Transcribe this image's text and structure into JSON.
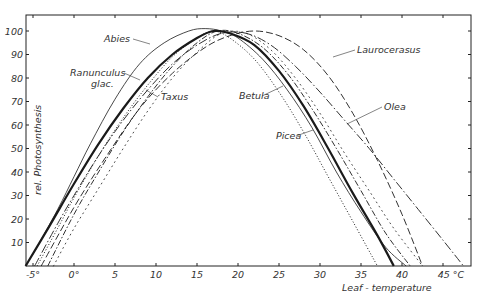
{
  "chart_data": {
    "type": "line",
    "title": "",
    "xlabel": "Leaf - temperature",
    "ylabel": "rel. Photosynthesis",
    "x_unit": "°C",
    "xlim": [
      -5.9,
      48.4
    ],
    "ylim": [
      0,
      107
    ],
    "grid": false,
    "legend_position": "inline labels",
    "x_ticks": [
      -5,
      0,
      5,
      10,
      15,
      20,
      25,
      30,
      35,
      40,
      45
    ],
    "x_tick_labels": [
      "-5°",
      "0°",
      "5",
      "10",
      "15",
      "20",
      "25",
      "30",
      "35",
      "40",
      "45 °C"
    ],
    "y_ticks": [
      10,
      20,
      30,
      40,
      50,
      60,
      70,
      80,
      90,
      100
    ],
    "y_tick_labels": [
      "10",
      "20",
      "30",
      "40",
      "50",
      "60",
      "70",
      "80",
      "90",
      "100"
    ],
    "series": [
      {
        "name": "Abies",
        "style": "thin-solid",
        "x": [
          -5,
          -2,
          0,
          2,
          5,
          8,
          11,
          14,
          16,
          18,
          20,
          23,
          26,
          29,
          32,
          35,
          38,
          40.5
        ],
        "y": [
          5,
          24,
          38,
          52,
          71,
          86,
          95,
          100,
          101,
          100,
          97,
          88,
          75,
          59,
          40,
          23,
          8,
          0
        ]
      },
      {
        "name": "Ranunculus glac.",
        "style": "thick-solid",
        "x": [
          -5.9,
          -3,
          0,
          3,
          6,
          9,
          12,
          15,
          17,
          19,
          22,
          25,
          28,
          31,
          34,
          37,
          39
        ],
        "y": [
          0,
          17,
          35,
          52,
          67,
          80,
          90,
          97,
          100,
          99,
          94,
          83,
          68,
          50,
          31,
          13,
          0
        ]
      },
      {
        "name": "Taxus",
        "style": "dash-dot",
        "x": [
          -3.2,
          0,
          3,
          6,
          9,
          12,
          15,
          17.5,
          20,
          23,
          26,
          29,
          32,
          35,
          38,
          41
        ],
        "y": [
          0,
          22,
          40,
          57,
          72,
          85,
          95,
          100,
          99,
          93,
          82,
          67,
          50,
          32,
          14,
          0
        ]
      },
      {
        "name": "Betula",
        "style": "circle-dotted",
        "x": [
          -2.5,
          0,
          3,
          6,
          9,
          12,
          15,
          18,
          21,
          24,
          27,
          30,
          33,
          36,
          39,
          42.5
        ],
        "y": [
          0,
          16,
          33,
          50,
          66,
          80,
          91,
          99,
          99,
          92,
          80,
          65,
          48,
          32,
          16,
          0
        ]
      },
      {
        "name": "Picea",
        "style": "dotted",
        "x": [
          -4.5,
          -2,
          0,
          3,
          6,
          9,
          12,
          15,
          17,
          19,
          22,
          25,
          28,
          31,
          34,
          37
        ],
        "y": [
          0,
          16,
          29,
          47,
          63,
          77,
          89,
          97,
          100,
          97,
          88,
          74,
          57,
          38,
          19,
          0
        ]
      },
      {
        "name": "Laurocerasus",
        "style": "long-dash",
        "x": [
          -4,
          0,
          4,
          8,
          12,
          16,
          19,
          22,
          25,
          28,
          31,
          34,
          37,
          40,
          42.5
        ],
        "y": [
          0,
          25,
          47,
          67,
          82,
          93,
          98,
          100,
          98,
          92,
          81,
          65,
          45,
          22,
          0
        ]
      },
      {
        "name": "Olea",
        "style": "long-dash-dot",
        "x": [
          -4.8,
          -2,
          0,
          3,
          6,
          9,
          12,
          15,
          18,
          21,
          24,
          27,
          30,
          33,
          36,
          39,
          42,
          45,
          47.5
        ],
        "y": [
          0,
          18,
          30,
          47,
          62,
          75,
          86,
          94,
          99,
          99,
          94,
          85,
          74,
          62,
          50,
          37,
          24,
          11,
          0
        ]
      }
    ],
    "annotations": [
      {
        "text": "Abies",
        "x": 104,
        "y": 42
      },
      {
        "text": "Ranunculus",
        "x": 70,
        "y": 76
      },
      {
        "text": "glac.",
        "x": 91,
        "y": 87
      },
      {
        "text": "Taxus",
        "x": 161,
        "y": 100
      },
      {
        "text": "Betula",
        "x": 239,
        "y": 99
      },
      {
        "text": "Picea",
        "x": 276,
        "y": 139
      },
      {
        "text": "Laurocerasus",
        "x": 357,
        "y": 53
      },
      {
        "text": "Olea",
        "x": 384,
        "y": 110
      }
    ]
  }
}
